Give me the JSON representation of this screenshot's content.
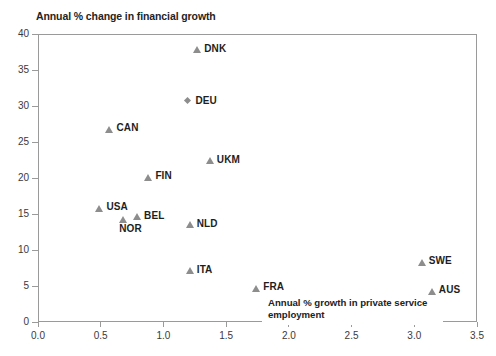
{
  "chart_data": {
    "type": "scatter",
    "title": "Annual % change in financial growth",
    "xlabel": "Annual % growth in private service employment",
    "ylabel": "Annual % change in financial growth",
    "xlim": [
      0.0,
      3.5
    ],
    "ylim": [
      0,
      40
    ],
    "grid": false,
    "legend": "none",
    "xticks": [
      "0.0",
      "0.5",
      "1.0",
      "1.5",
      "2.0",
      "2.5",
      "3.0",
      "3.5"
    ],
    "xtick_values": [
      0.0,
      0.5,
      1.0,
      1.5,
      2.0,
      2.5,
      3.0,
      3.5
    ],
    "yticks": [
      "0",
      "5",
      "10",
      "15",
      "20",
      "25",
      "30",
      "35",
      "40"
    ],
    "ytick_values": [
      0,
      5,
      10,
      15,
      20,
      25,
      30,
      35,
      40
    ],
    "marker_color": "#8d8d8d",
    "points": [
      {
        "label": "DNK",
        "x": 1.27,
        "y": 37.8,
        "marker": "triangle",
        "label_pos": "right"
      },
      {
        "label": "DEU",
        "x": 1.2,
        "y": 30.6,
        "marker": "diamond",
        "label_pos": "right"
      },
      {
        "label": "CAN",
        "x": 0.57,
        "y": 26.8,
        "marker": "triangle",
        "label_pos": "right"
      },
      {
        "label": "UKM",
        "x": 1.37,
        "y": 22.4,
        "marker": "triangle",
        "label_pos": "right"
      },
      {
        "label": "FIN",
        "x": 0.88,
        "y": 20.1,
        "marker": "triangle",
        "label_pos": "right"
      },
      {
        "label": "USA",
        "x": 0.49,
        "y": 15.8,
        "marker": "triangle",
        "label_pos": "right"
      },
      {
        "label": "BEL",
        "x": 0.79,
        "y": 14.6,
        "marker": "triangle",
        "label_pos": "right"
      },
      {
        "label": "NOR",
        "x": 0.68,
        "y": 14.3,
        "marker": "triangle",
        "label_pos": "below"
      },
      {
        "label": "NLD",
        "x": 1.21,
        "y": 13.5,
        "marker": "triangle",
        "label_pos": "right"
      },
      {
        "label": "ITA",
        "x": 1.21,
        "y": 7.1,
        "marker": "triangle",
        "label_pos": "right"
      },
      {
        "label": "FRA",
        "x": 1.74,
        "y": 4.7,
        "marker": "triangle",
        "label_pos": "right"
      },
      {
        "label": "SWE",
        "x": 3.06,
        "y": 8.3,
        "marker": "triangle",
        "label_pos": "right"
      },
      {
        "label": "AUS",
        "x": 3.14,
        "y": 4.3,
        "marker": "triangle",
        "label_pos": "right"
      }
    ]
  }
}
